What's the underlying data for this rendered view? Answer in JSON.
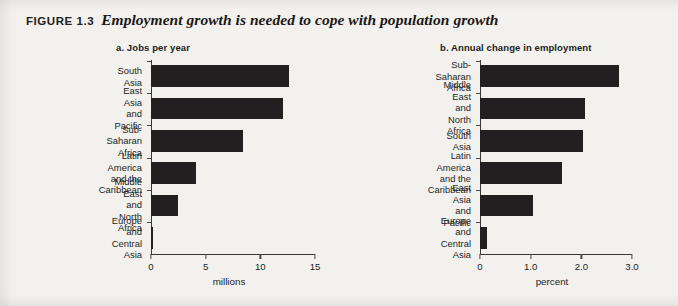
{
  "figure": {
    "number": "FIGURE 1.3",
    "caption": "Employment growth is needed to cope with population growth",
    "background_color": "#f2f1ee",
    "bar_color": "#231f20",
    "axis_color": "#3b3836",
    "text_color": "#221f1d"
  },
  "chart_data": [
    {
      "type": "bar",
      "orientation": "horizontal",
      "title": "a. Jobs per year",
      "panel_letter": "a.",
      "categories": [
        "South Asia",
        "East Asia and Pacific",
        "Sub-Saharan Africa",
        "Latin America\nand the Caribbean",
        "Middle East\nand North Africa",
        "Europe and Central Asia"
      ],
      "values": [
        12.6,
        12.1,
        8.4,
        4.1,
        2.5,
        0.2
      ],
      "xlabel": "millions",
      "ylabel": "",
      "xlim": [
        0,
        15
      ],
      "xticks": [
        0,
        5,
        10,
        15
      ],
      "xtick_labels": [
        "0",
        "5",
        "10",
        "15"
      ],
      "grid": false,
      "legend": false
    },
    {
      "type": "bar",
      "orientation": "horizontal",
      "title": "b. Annual change in employment",
      "panel_letter": "b.",
      "categories": [
        "Sub-Saharan Africa",
        "Middle East\nand North Africa",
        "South Asia",
        "Latin America\nand the Caribbean",
        "East Asia and Pacific",
        "Europe and Central Asia"
      ],
      "values": [
        2.75,
        2.08,
        2.04,
        1.62,
        1.04,
        0.13
      ],
      "xlabel": "percent",
      "ylabel": "",
      "xlim": [
        0,
        3.0
      ],
      "xticks": [
        0,
        1.0,
        2.0,
        3.0
      ],
      "xtick_labels": [
        "0",
        "1.0",
        "2.0",
        "3.0"
      ],
      "grid": false,
      "legend": false
    }
  ]
}
